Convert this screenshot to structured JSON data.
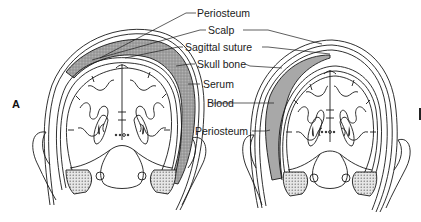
{
  "figure": {
    "panels": [
      {
        "letter": "A",
        "fluid_layer": "Serum",
        "fill": "stippled-gray"
      },
      {
        "letter": "B",
        "fluid_layer": "Blood",
        "fill": "solid-gray"
      }
    ],
    "labels": {
      "periosteum_top": "Periosteum",
      "scalp": "Scalp",
      "sagittal_suture": "Sagittal suture",
      "skull_bone": "Skull bone",
      "serum": "Serum",
      "blood": "Blood",
      "periosteum_bottom": "Periosteum"
    },
    "colors": {
      "line": "#1a1a1a",
      "serum_fill": "#9a9a9a",
      "blood_fill": "#a8a8a8",
      "background": "#ffffff"
    }
  }
}
